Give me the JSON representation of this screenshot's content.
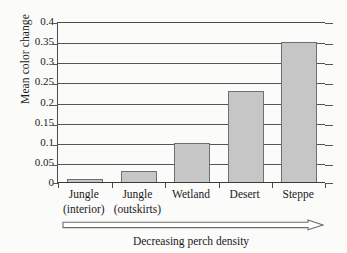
{
  "chart_data": {
    "type": "bar",
    "title": "",
    "xlabel": "Decreasing perch density",
    "ylabel": "Mean color change",
    "categories": [
      "Jungle (interior)",
      "Jungle (outskirts)",
      "Wetland",
      "Desert",
      "Steppe"
    ],
    "category_lines": [
      {
        "line1": "Jungle",
        "line2": "(interior)"
      },
      {
        "line1": "Jungle",
        "line2": "(outskirts)"
      },
      {
        "line1": "Wetland",
        "line2": ""
      },
      {
        "line1": "Desert",
        "line2": ""
      },
      {
        "line1": "Steppe",
        "line2": ""
      }
    ],
    "values": [
      0.01,
      0.03,
      0.1,
      0.228,
      0.35
    ],
    "ylim": [
      0,
      0.4
    ],
    "yticks": [
      0,
      0.05,
      0.1,
      0.15,
      0.2,
      0.25,
      0.3,
      0.35,
      0.4
    ],
    "ytick_labels": [
      "0",
      "0.05",
      "0.1",
      "0.15",
      "0.2",
      "0.25",
      "0.3",
      "0.35",
      "0.4"
    ],
    "grid": true,
    "legend": "none",
    "bar_fill_color": "#c6c6c6",
    "bar_edge_color": "#6f6f6f",
    "axis_color": "#4a4a4a",
    "gridline_color": "#56565a",
    "annotations": [
      {
        "name": "decreasing-perch-density-arrow",
        "kind": "arrow",
        "direction": "right",
        "label": "Decreasing perch density"
      }
    ]
  }
}
